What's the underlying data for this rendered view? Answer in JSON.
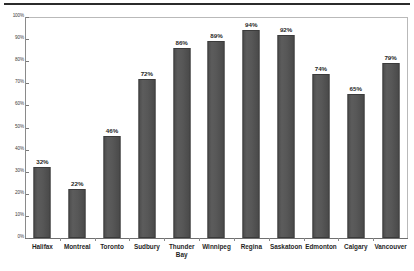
{
  "chart_data": {
    "type": "bar",
    "title": "",
    "subtitle": "",
    "xlabel": "",
    "ylabel": "",
    "categories": [
      "Halifax",
      "Montreal",
      "Toronto",
      "Sudbury",
      "Thunder\nBay",
      "Winnipeg",
      "Regina",
      "Saskatoon",
      "Edmonton",
      "Calgary",
      "Vancouver"
    ],
    "values": [
      32,
      22,
      46,
      72,
      86,
      89,
      94,
      92,
      74,
      65,
      79
    ],
    "value_labels": [
      "32%",
      "22%",
      "46%",
      "72%",
      "86%",
      "89%",
      "94%",
      "92%",
      "74%",
      "65%",
      "79%"
    ],
    "ylim": [
      0,
      100
    ],
    "ytick_values": [
      0,
      10,
      20,
      30,
      40,
      50,
      60,
      70,
      80,
      90,
      100
    ],
    "ytick_labels": [
      "0%",
      "10%",
      "20%",
      "30%",
      "40%",
      "50%",
      "60%",
      "70%",
      "80%",
      "90%",
      "100%"
    ],
    "grid": false,
    "legend": false,
    "legend_position": "none",
    "series": [
      {
        "name": "",
        "values": [
          32,
          22,
          46,
          72,
          86,
          89,
          94,
          92,
          74,
          65,
          79
        ]
      }
    ],
    "colors": {
      "bar_fill": "#555555",
      "bar_edge": "#3b3b3b",
      "plot_background": "#ffffff",
      "plot_border": "#b9b9b9",
      "axis_line": "#7a7a7a",
      "text": "#1f1f1f",
      "tick_text": "#3a3a3a",
      "top_rule": "#2b2b2b"
    }
  }
}
